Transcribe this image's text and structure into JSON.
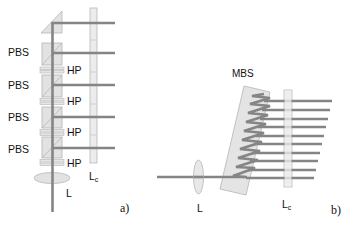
{
  "panel_a": {
    "caption": "a)",
    "pbs_labels": [
      "PBS",
      "PBS",
      "PBS",
      "PBS"
    ],
    "hp_labels": [
      "HP",
      "HP",
      "HP",
      "HP"
    ],
    "lens_label": "L",
    "lc_label_main": "L",
    "lc_label_sub": "c"
  },
  "panel_b": {
    "caption": "b)",
    "mbs_label": "MBS",
    "lens_label": "L",
    "lc_label_main": "L",
    "lc_label_sub": "c",
    "output_beam_count": 10
  },
  "colors": {
    "beam": "#858585",
    "element_fill": "#e6e6e6",
    "element_stroke": "#b5b5b5",
    "text": "#111111"
  }
}
